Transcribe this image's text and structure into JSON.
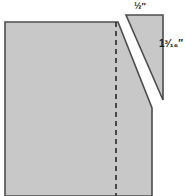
{
  "figure": {
    "background_color": "#ffffff",
    "fill_color": "#c8c8c8",
    "stroke_color": "#4d4d4d",
    "dash_color": "#333333",
    "label_color": "#1a1a1a"
  },
  "labels": {
    "top": {
      "whole": "",
      "fraction": "½",
      "unit": "″",
      "text": "½″",
      "meaning": "one-half inch"
    },
    "right": {
      "whole": "1",
      "fraction": "³⁄₁₆",
      "unit": "″",
      "text": "1³⁄₁₆″",
      "meaning": "one and three-sixteenths inches"
    }
  },
  "shapes": {
    "main_panel": {
      "name": "main-fabric-panel",
      "points": "5,22 118,22 152,108 152,196 5,196"
    },
    "wedge": {
      "name": "cut-wedge-triangle",
      "points": "126,15 163,15 163,100"
    },
    "fold_line": {
      "name": "dashed-fold-line",
      "x": 116,
      "y1": 22,
      "y2": 196
    }
  }
}
